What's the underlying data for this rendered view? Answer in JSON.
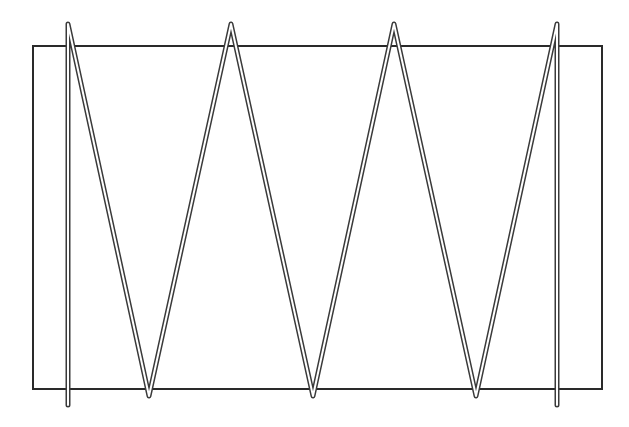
{
  "diagram": {
    "type": "zigzag-wire-over-rectangle",
    "canvas": {
      "width": 629,
      "height": 427,
      "background": "#ffffff"
    },
    "rectangle": {
      "x": 33,
      "y": 46,
      "width": 569,
      "height": 343,
      "stroke": "#2a2a2a",
      "stroke_width": 2
    },
    "wire": {
      "outline_color": "#3a3a3a",
      "fill_color": "#ffffff",
      "outer_width": 5,
      "inner_width": 2,
      "points": [
        [
          68,
          405
        ],
        [
          68,
          24
        ],
        [
          149,
          396
        ],
        [
          231,
          24
        ],
        [
          313,
          396
        ],
        [
          394,
          24
        ],
        [
          476,
          396
        ],
        [
          557,
          24
        ],
        [
          557,
          405
        ]
      ]
    }
  }
}
